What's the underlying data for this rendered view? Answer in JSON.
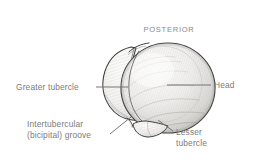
{
  "figure": {
    "background_color": "#ffffff",
    "label_color": "#7b7b7b",
    "line_color": "#6f6f6f",
    "bone_outline_color": "#3c3c3c",
    "bone_fill_color": "#f2f1ef"
  },
  "labels": {
    "orientation": "POSTERIOR",
    "greater_tubercle": "Greater tubercle",
    "head": "Head",
    "intertubercular_groove": "Intertubercular\n(bicipital) groove",
    "lesser_tubercle": "Lesser\ntubercle"
  },
  "structures": [
    {
      "name": "head",
      "label": "Head",
      "description": "large rounded articular sphere on the right side"
    },
    {
      "name": "greater-tubercle",
      "label": "Greater tubercle",
      "description": "broad lobe on the left side of the head"
    },
    {
      "name": "intertubercular-groove",
      "label": "Intertubercular (bicipital) groove",
      "description": "notch between the greater and lesser tubercles"
    },
    {
      "name": "lesser-tubercle",
      "label": "Lesser tubercle",
      "description": "small rounded knob at the inferior margin"
    }
  ]
}
